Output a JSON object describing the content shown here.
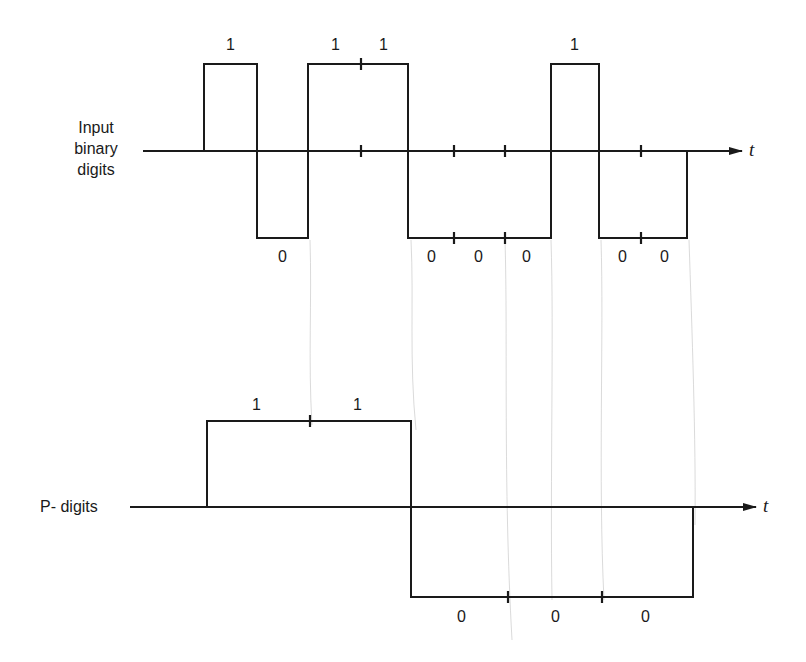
{
  "figure": {
    "top_signal": {
      "label_lines": [
        "Input",
        "binary",
        "digits"
      ],
      "axis_symbol": "t",
      "bits": [
        "1",
        "0",
        "1",
        "1",
        "0",
        "0",
        "0",
        "1",
        "0",
        "0"
      ],
      "bit_labels": [
        {
          "text": "1",
          "x": 230,
          "y": 36
        },
        {
          "text": "0",
          "x": 282,
          "y": 250
        },
        {
          "text": "1",
          "x": 335,
          "y": 36
        },
        {
          "text": "1",
          "x": 382,
          "y": 36
        },
        {
          "text": "0",
          "x": 431,
          "y": 250
        },
        {
          "text": "0",
          "x": 478,
          "y": 250
        },
        {
          "text": "0",
          "x": 528,
          "y": 250
        },
        {
          "text": "1",
          "x": 573,
          "y": 36
        },
        {
          "text": "0",
          "x": 622,
          "y": 250
        },
        {
          "text": "0",
          "x": 664,
          "y": 250
        }
      ]
    },
    "bottom_signal": {
      "label": "P- digits",
      "axis_symbol": "t",
      "bits": [
        "1",
        "1",
        "0",
        "0",
        "0"
      ],
      "bit_labels": [
        {
          "text": "1",
          "x": 257,
          "y": 396
        },
        {
          "text": "1",
          "x": 357,
          "y": 396
        },
        {
          "text": "0",
          "x": 462,
          "y": 608
        },
        {
          "text": "0",
          "x": 555,
          "y": 608
        },
        {
          "text": "0",
          "x": 646,
          "y": 608
        }
      ]
    },
    "colors": {
      "line": "#1a1a1a",
      "background": "#ffffff",
      "guide": "#bdbdbd"
    }
  }
}
